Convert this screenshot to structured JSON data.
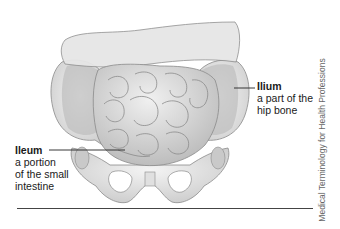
{
  "figure": {
    "labels": [
      {
        "id": "ilium",
        "title": "Ilium",
        "description_lines": [
          "a part of the",
          "hip bone"
        ]
      },
      {
        "id": "ileum",
        "title": "Ileum",
        "description_lines": [
          "a portion",
          "of the small",
          "intestine"
        ]
      }
    ],
    "credit": "Medical Terminology for Health Professions"
  },
  "colors": {
    "text": "#1a1a1a",
    "bone": "#ececec",
    "bone_shadow": "#c8c8c8",
    "intestine": "#d8d8d8",
    "colon": "#e8e8e8",
    "outline": "#7a7a7a",
    "rule": "#444444"
  }
}
